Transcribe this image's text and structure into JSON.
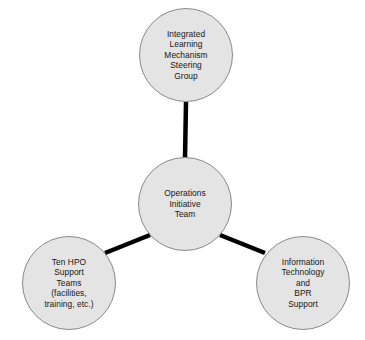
{
  "diagram": {
    "type": "hub-and-spoke-circle-diagram",
    "background_color": "#ffffff",
    "node_fill_color": "#e4e4e4",
    "node_border_color": "#8a8a8a",
    "connector_color": "#000000",
    "text_color": "#161616",
    "nodes": [
      {
        "id": "steering-group",
        "label": "Integrated\nLearning\nMechanism\nSteering\nGroup",
        "cx": 186,
        "cy": 55,
        "r": 47
      },
      {
        "id": "operations-initiative-team",
        "label": "Operations\nInitiative\nTeam",
        "cx": 185,
        "cy": 204,
        "r": 47
      },
      {
        "id": "hpo-support-teams",
        "label": "Ten HPO\nSupport\nTeams\n(facilities,\ntraining, etc.)",
        "cx": 69,
        "cy": 283,
        "r": 47
      },
      {
        "id": "it-bpr-support",
        "label": "Information\nTechnology\nand\nBPR\nSupport",
        "cx": 303,
        "cy": 283,
        "r": 47
      }
    ],
    "connectors": [
      {
        "id": "center-to-steering-group",
        "x1": 185,
        "y1": 158,
        "x2": 186,
        "y2": 102
      },
      {
        "id": "center-to-hpo-support",
        "x1": 150,
        "y1": 235,
        "x2": 105,
        "y2": 253
      },
      {
        "id": "center-to-it-bpr",
        "x1": 220,
        "y1": 235,
        "x2": 265,
        "y2": 253
      }
    ]
  }
}
